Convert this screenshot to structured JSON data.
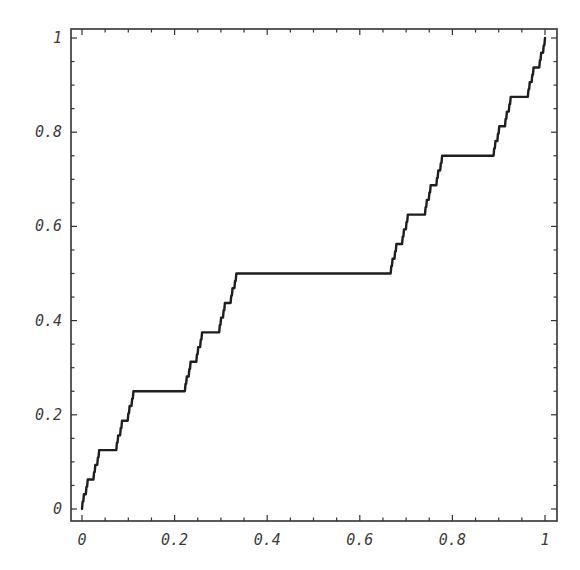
{
  "chart_data": {
    "type": "line",
    "title": "",
    "xlabel": "",
    "ylabel": "",
    "xlim": [
      0,
      1
    ],
    "ylim": [
      0,
      1
    ],
    "grid": false,
    "legend": null,
    "frame": "box",
    "x_ticks": [
      0,
      0.2,
      0.4,
      0.6,
      0.8,
      1
    ],
    "x_tick_labels": [
      "0",
      "0.2",
      "0.4",
      "0.6",
      "0.8",
      "1"
    ],
    "y_ticks": [
      0,
      0.2,
      0.4,
      0.6,
      0.8,
      1
    ],
    "y_tick_labels": [
      "0",
      "0.2",
      "0.4",
      "0.6",
      "0.8",
      "1"
    ],
    "minor_tick_step": 0.05,
    "curve_description": "Cantor function (devil's staircase): plateaus at y=1/2 over [1/3,2/3], y=1/4 over [1/9,2/9], y=3/4 over [7/9,8/9], etc.",
    "recursion_depth": 6,
    "series": [
      {
        "name": "Cantor function",
        "color": "#1e1e1e",
        "key_points": [
          {
            "x": 0,
            "y": 0
          },
          {
            "x": 0.1111,
            "y": 0.25
          },
          {
            "x": 0.2222,
            "y": 0.25
          },
          {
            "x": 0.3333,
            "y": 0.5
          },
          {
            "x": 0.6667,
            "y": 0.5
          },
          {
            "x": 0.7778,
            "y": 0.75
          },
          {
            "x": 0.8889,
            "y": 0.75
          },
          {
            "x": 1,
            "y": 1
          }
        ]
      }
    ]
  },
  "plot_area": {
    "frame_left": 71,
    "frame_right": 557,
    "frame_top": 29,
    "frame_bottom": 521,
    "x0_px": 82,
    "x1_px": 545,
    "y0_px": 509,
    "y1_px": 38
  }
}
